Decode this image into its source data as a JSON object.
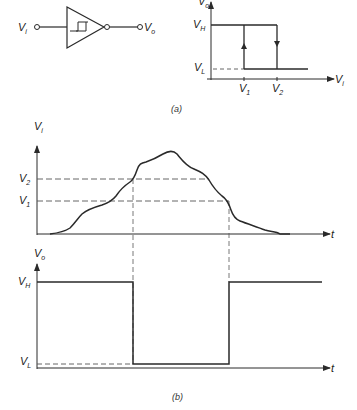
{
  "figure": {
    "part_a": {
      "caption": "(a)",
      "schmitt_trigger": {
        "input_label": "V",
        "input_sub": "i",
        "output_label": "V",
        "output_sub": "o",
        "symbol": "hysteresis-icon"
      },
      "transfer_characteristic": {
        "y_axis_label": "V",
        "y_axis_sub": "o",
        "x_axis_label": "V",
        "x_axis_sub": "i",
        "high_level_label": "V",
        "high_level_sub": "H",
        "low_level_label": "V",
        "low_level_sub": "L",
        "threshold_1_label": "V",
        "threshold_1_sub": "1",
        "threshold_2_label": "V",
        "threshold_2_sub": "2"
      }
    },
    "part_b": {
      "caption": "(b)",
      "input_plot": {
        "y_axis_label": "V",
        "y_axis_sub": "i",
        "x_axis_label": "t",
        "level_2_label": "V",
        "level_2_sub": "2",
        "level_1_label": "V",
        "level_1_sub": "1"
      },
      "output_plot": {
        "y_axis_label": "V",
        "y_axis_sub": "o",
        "x_axis_label": "t",
        "high_label": "V",
        "high_sub": "H",
        "low_label": "V",
        "low_sub": "L"
      }
    }
  },
  "colors": {
    "line": "#2a2a2a",
    "dash": "#555555",
    "background": "#ffffff"
  }
}
